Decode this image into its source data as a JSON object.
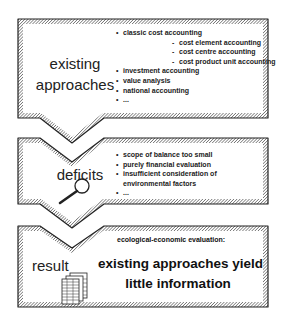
{
  "diagram": {
    "boxes": [
      {
        "title_lines": [
          "existing",
          "approaches"
        ],
        "items": [
          {
            "bullet": "•",
            "text": "classic cost accounting",
            "level": 0
          },
          {
            "bullet": "-",
            "text": "cost element accounting",
            "level": 1
          },
          {
            "bullet": "-",
            "text": "cost centre accounting",
            "level": 1
          },
          {
            "bullet": "-",
            "text": "cost product unit accounting",
            "level": 1
          },
          {
            "bullet": "•",
            "text": "investment accounting",
            "level": 0
          },
          {
            "bullet": "•",
            "text": "value analysis",
            "level": 0
          },
          {
            "bullet": "•",
            "text": "national accounting",
            "level": 0
          },
          {
            "bullet": "•",
            "text": "...",
            "level": 0
          }
        ]
      },
      {
        "title": "deficits",
        "icon": "magnifier-icon",
        "items": [
          {
            "bullet": "•",
            "text": "scope of balance too small"
          },
          {
            "bullet": "•",
            "text": "purely financial evaluation"
          },
          {
            "bullet": "•",
            "text": "insufficient consideration of"
          },
          {
            "bullet": "",
            "text": "environmental factors"
          },
          {
            "bullet": "•",
            "text": "..."
          }
        ]
      },
      {
        "title": "result",
        "icon": "documents-icon",
        "heading": "ecological-economic evaluation:",
        "conclusion_lines": [
          "existing approaches yield",
          "little information"
        ]
      }
    ]
  }
}
